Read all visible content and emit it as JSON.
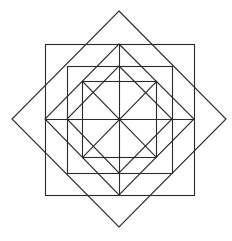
{
  "figure": {
    "width": 232,
    "height": 241,
    "stroke_color": "#2b2b2b",
    "background": "#ffffff",
    "stroke_width": 1.1,
    "shapes": {
      "large_diamond": {
        "points": "119,11 226,119 119,227 12,119"
      },
      "outer_square": {
        "x": 45,
        "y": 44,
        "w": 149,
        "h": 151
      },
      "outer_square_inscribed_diamond": {
        "points": "119,44 194,119 119,195 45,119"
      },
      "middle_square": {
        "x": 67,
        "y": 66,
        "w": 105,
        "h": 107
      },
      "middle_square_inscribed_diamond": {
        "points": "119,66 172,119 119,173 67,119"
      },
      "inner_square": {
        "x": 82,
        "y": 81,
        "w": 74,
        "h": 76
      },
      "inner_diagonal_1": {
        "x1": 82,
        "y1": 81,
        "x2": 156,
        "y2": 157
      },
      "inner_diagonal_2": {
        "x1": 156,
        "y1": 81,
        "x2": 82,
        "y2": 157
      },
      "vertical_center_line": {
        "x1": 119,
        "y1": 44,
        "x2": 119,
        "y2": 195
      },
      "horizontal_center_line": {
        "x1": 45,
        "y1": 119,
        "x2": 194,
        "y2": 119
      }
    }
  }
}
